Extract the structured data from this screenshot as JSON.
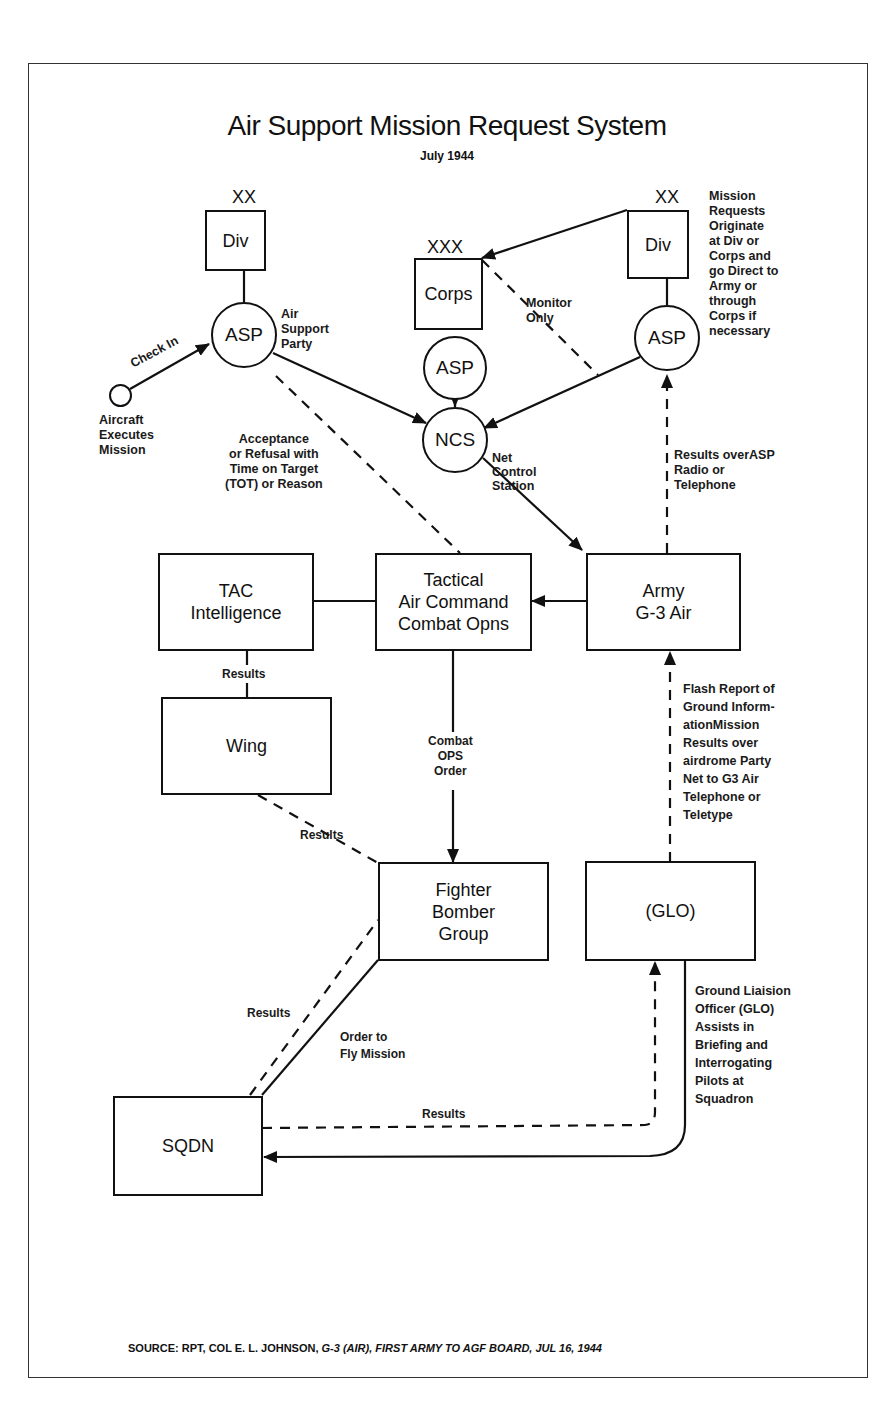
{
  "title": "Air Support Mission Request System",
  "subtitle": "July 1944",
  "nodes": {
    "div_left": {
      "label": "Div",
      "echelon": "XX"
    },
    "asp_left": {
      "label": "ASP",
      "note": "Air\nSupport\nParty"
    },
    "aircraft": {
      "label": "Aircraft\nExecutes\nMission"
    },
    "corps": {
      "label": "Corps",
      "echelon": "XXX"
    },
    "asp_mid": {
      "label": "ASP"
    },
    "div_right": {
      "label": "Div",
      "echelon": "XX"
    },
    "asp_right": {
      "label": "ASP"
    },
    "ncs": {
      "label": "NCS",
      "note": "Net\nControl\nStation"
    },
    "tac_intel": {
      "label": "TAC\nIntelligence"
    },
    "tac_cmd": {
      "label": "Tactical\nAir Command\nCombat Opns"
    },
    "army": {
      "label": "Army\nG-3 Air"
    },
    "wing": {
      "label": "Wing"
    },
    "fbg": {
      "label": "Fighter\nBomber\nGroup"
    },
    "glo": {
      "label": "(GLO)"
    },
    "sqdn": {
      "label": "SQDN"
    }
  },
  "annotations": {
    "mission_requests": "Mission\nRequests\nOriginate\nat Div or\nCorps and\ngo Direct to\nArmy or\nthrough\nCorps if\nnecessary",
    "check_in": "Check In",
    "monitor_only": "Monitor\nOnly",
    "acceptance": "Acceptance\nor Refusal with\nTime on Target\n(TOT) or Reason",
    "results_asp": "Results overASP\nRadio or\nTelephone",
    "results_intel": "Results",
    "combat_ops_order": "Combat\nOPS\nOrder",
    "results_wing": "Results",
    "flash_report": "Flash Report of\nGround Inform-\nationMission\nResults over\nairdrome Party\nNet to G3 Air\nTelephone or\nTeletype",
    "results_sqdn_fbg": "Results",
    "order_to_fly": "Order to\nFly Mission",
    "glo_note": "Ground Liaision\nOfficer (GLO)\nAssists in\nBriefing and\nInterrogating\nPilots at\nSquadron",
    "results_sqdn_glo": "Results"
  },
  "source": {
    "prefix": "SOURCE:  RPT, COL E. L. JOHNSON, ",
    "italic": "G-3 (AIR), FIRST ARMY TO AGF BOARD, JUL 16, 1944"
  }
}
